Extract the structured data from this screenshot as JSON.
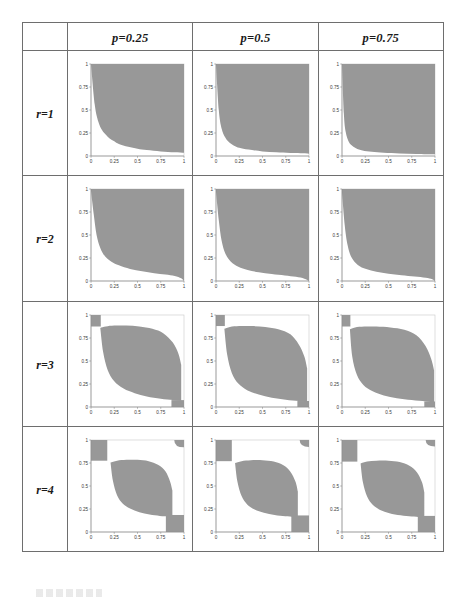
{
  "figure": {
    "title": "",
    "corner_label": "",
    "columns": [
      {
        "id": "col-p025",
        "label": "p=0.25",
        "p": 0.25
      },
      {
        "id": "col-p05",
        "label": "p=0.5",
        "p": 0.5
      },
      {
        "id": "col-p075",
        "label": "p=0.75",
        "p": 0.75
      }
    ],
    "rows": [
      {
        "id": "row-r1",
        "label": "r=1",
        "r": 1
      },
      {
        "id": "row-r2",
        "label": "r=2",
        "r": 2
      },
      {
        "id": "row-r3",
        "label": "r=3",
        "r": 3
      },
      {
        "id": "row-r4",
        "label": "r=4",
        "r": 4
      }
    ]
  },
  "axes": {
    "x_ticks": [
      "0",
      "0.25",
      "0.5",
      "0.75",
      "1"
    ],
    "y_ticks": [
      "0",
      "0.25",
      "0.5",
      "0.75",
      "1"
    ],
    "xlim": [
      0,
      1
    ],
    "ylim": [
      0,
      1
    ]
  },
  "colors": {
    "region_fill": "#989898",
    "grid_border": "#6e6e6e",
    "axis": "#8c8c8c",
    "frame": "#c8c8c8",
    "text": "#1a1a1a"
  },
  "chart_data": {
    "type": "area",
    "title": "",
    "xlabel": "",
    "ylabel": "",
    "xlim": [
      0,
      1
    ],
    "ylim": [
      0,
      1
    ],
    "grid": false,
    "legend": "none",
    "x_ticks": [
      0,
      0.25,
      0.5,
      0.75,
      1
    ],
    "y_ticks": [
      0,
      0.25,
      0.5,
      0.75,
      1
    ],
    "row_parameter": "r",
    "col_parameter": "p",
    "row_values": [
      1,
      2,
      3,
      4
    ],
    "col_values": [
      0.25,
      0.5,
      0.75
    ],
    "panels": [
      {
        "id": "r1-p025",
        "r": 1,
        "p": 0.25,
        "shape": "upper-right-hyperbolic",
        "boundary_x": [
          0.0,
          0.04,
          0.08,
          0.12,
          0.16,
          0.2,
          0.25,
          0.3,
          0.4,
          0.5,
          0.6,
          0.75,
          0.9,
          1.0
        ],
        "boundary_y": [
          1.0,
          0.56,
          0.37,
          0.28,
          0.23,
          0.19,
          0.16,
          0.13,
          0.1,
          0.08,
          0.065,
          0.05,
          0.04,
          0.035
        ],
        "fill_side": "above",
        "corner_blocks": []
      },
      {
        "id": "r1-p05",
        "r": 1,
        "p": 0.5,
        "shape": "upper-right-hyperbolic",
        "boundary_x": [
          0.0,
          0.03,
          0.06,
          0.1,
          0.14,
          0.2,
          0.25,
          0.35,
          0.5,
          0.65,
          0.8,
          1.0
        ],
        "boundary_y": [
          1.0,
          0.5,
          0.3,
          0.2,
          0.15,
          0.11,
          0.09,
          0.07,
          0.05,
          0.04,
          0.032,
          0.025
        ],
        "fill_side": "above",
        "corner_blocks": []
      },
      {
        "id": "r1-p075",
        "r": 1,
        "p": 0.75,
        "shape": "upper-right-hyperbolic-steep",
        "boundary_x": [
          0.0,
          0.02,
          0.04,
          0.07,
          0.1,
          0.15,
          0.22,
          0.32,
          0.45,
          0.62,
          0.8,
          1.0
        ],
        "boundary_y": [
          1.0,
          0.46,
          0.26,
          0.16,
          0.12,
          0.085,
          0.06,
          0.045,
          0.034,
          0.026,
          0.021,
          0.018
        ],
        "fill_side": "above",
        "corner_blocks": []
      },
      {
        "id": "r2-p025",
        "r": 2,
        "p": 0.25,
        "shape": "rounded-upper-right",
        "boundary_x": [
          0.0,
          0.03,
          0.06,
          0.1,
          0.15,
          0.22,
          0.3,
          0.42,
          0.55,
          0.68,
          0.8,
          0.9,
          0.97,
          1.0
        ],
        "boundary_y": [
          0.98,
          0.72,
          0.5,
          0.36,
          0.27,
          0.21,
          0.17,
          0.13,
          0.105,
          0.085,
          0.07,
          0.055,
          0.03,
          0.0
        ],
        "top_left_start": [
          0.0,
          0.985
        ],
        "fill_side": "above",
        "corner_blocks": []
      },
      {
        "id": "r2-p05",
        "r": 2,
        "p": 0.5,
        "shape": "rounded-upper-right",
        "boundary_x": [
          0.0,
          0.03,
          0.06,
          0.1,
          0.16,
          0.24,
          0.34,
          0.46,
          0.6,
          0.74,
          0.86,
          0.95,
          1.0
        ],
        "boundary_y": [
          0.97,
          0.66,
          0.44,
          0.3,
          0.21,
          0.155,
          0.12,
          0.095,
          0.075,
          0.06,
          0.045,
          0.025,
          0.0
        ],
        "fill_side": "above",
        "corner_blocks": []
      },
      {
        "id": "r2-p075",
        "r": 2,
        "p": 0.75,
        "shape": "rounded-upper-right",
        "boundary_x": [
          0.0,
          0.03,
          0.06,
          0.1,
          0.17,
          0.26,
          0.37,
          0.5,
          0.64,
          0.78,
          0.9,
          0.97,
          1.0
        ],
        "boundary_y": [
          0.96,
          0.6,
          0.39,
          0.26,
          0.175,
          0.13,
          0.1,
          0.08,
          0.062,
          0.048,
          0.035,
          0.02,
          0.0
        ],
        "fill_side": "above",
        "corner_blocks": []
      },
      {
        "id": "r3-p025",
        "r": 3,
        "p": 0.25,
        "shape": "s-curve-lens",
        "upper_x": [
          0.1,
          0.16,
          0.25,
          0.38,
          0.52,
          0.66,
          0.78,
          0.88,
          0.94,
          0.97
        ],
        "upper_y": [
          0.86,
          0.875,
          0.885,
          0.885,
          0.875,
          0.85,
          0.8,
          0.7,
          0.58,
          0.46
        ],
        "lower_x": [
          0.1,
          0.13,
          0.18,
          0.25,
          0.35,
          0.47,
          0.6,
          0.75,
          0.88,
          0.97
        ],
        "lower_y": [
          0.86,
          0.6,
          0.4,
          0.28,
          0.2,
          0.15,
          0.115,
          0.09,
          0.075,
          0.065
        ],
        "fill_side": "between",
        "corner_blocks": [
          {
            "corner": "top-left",
            "x0": 0.0,
            "x1": 0.105,
            "y0": 0.875,
            "y1": 1.0
          },
          {
            "corner": "bottom-right",
            "x0": 0.865,
            "x1": 1.0,
            "y0": 0.0,
            "y1": 0.075
          }
        ]
      },
      {
        "id": "r3-p05",
        "r": 3,
        "p": 0.5,
        "shape": "s-curve-lens",
        "upper_x": [
          0.09,
          0.15,
          0.25,
          0.38,
          0.53,
          0.67,
          0.8,
          0.89,
          0.95,
          0.98
        ],
        "upper_y": [
          0.85,
          0.87,
          0.88,
          0.88,
          0.87,
          0.845,
          0.79,
          0.68,
          0.55,
          0.42
        ],
        "lower_x": [
          0.09,
          0.12,
          0.17,
          0.24,
          0.34,
          0.46,
          0.6,
          0.75,
          0.89,
          0.98
        ],
        "lower_y": [
          0.85,
          0.57,
          0.37,
          0.255,
          0.18,
          0.135,
          0.1,
          0.08,
          0.065,
          0.055
        ],
        "fill_side": "between",
        "corner_blocks": [
          {
            "corner": "top-left",
            "x0": 0.0,
            "x1": 0.095,
            "y0": 0.88,
            "y1": 1.0
          },
          {
            "corner": "bottom-right",
            "x0": 0.875,
            "x1": 1.0,
            "y0": 0.0,
            "y1": 0.065
          }
        ]
      },
      {
        "id": "r3-p075",
        "r": 3,
        "p": 0.75,
        "shape": "s-curve-lens",
        "upper_x": [
          0.085,
          0.14,
          0.24,
          0.37,
          0.52,
          0.67,
          0.8,
          0.9,
          0.96,
          0.99
        ],
        "upper_y": [
          0.845,
          0.865,
          0.875,
          0.875,
          0.865,
          0.84,
          0.78,
          0.66,
          0.52,
          0.4
        ],
        "lower_x": [
          0.085,
          0.11,
          0.16,
          0.23,
          0.33,
          0.45,
          0.59,
          0.75,
          0.9,
          0.99
        ],
        "lower_y": [
          0.845,
          0.55,
          0.35,
          0.24,
          0.17,
          0.125,
          0.095,
          0.075,
          0.06,
          0.05
        ],
        "fill_side": "between",
        "corner_blocks": [
          {
            "corner": "top-left",
            "x0": 0.0,
            "x1": 0.09,
            "y0": 0.875,
            "y1": 1.0
          },
          {
            "corner": "bottom-right",
            "x0": 0.885,
            "x1": 1.0,
            "y0": 0.0,
            "y1": 0.06
          }
        ]
      },
      {
        "id": "r4-p025",
        "r": 4,
        "p": 0.25,
        "shape": "s-curve-lens-4corner",
        "upper_x": [
          0.21,
          0.28,
          0.38,
          0.5,
          0.62,
          0.72,
          0.8,
          0.85,
          0.875
        ],
        "upper_y": [
          0.755,
          0.775,
          0.785,
          0.785,
          0.77,
          0.73,
          0.66,
          0.55,
          0.45
        ],
        "lower_x": [
          0.21,
          0.235,
          0.28,
          0.34,
          0.42,
          0.52,
          0.63,
          0.74,
          0.83,
          0.875
        ],
        "lower_y": [
          0.755,
          0.56,
          0.4,
          0.31,
          0.255,
          0.215,
          0.19,
          0.175,
          0.17,
          0.17
        ],
        "fill_side": "between",
        "corner_blocks": [
          {
            "corner": "top-left",
            "x0": 0.0,
            "x1": 0.175,
            "y0": 0.775,
            "y1": 1.0
          },
          {
            "corner": "top-right",
            "x0": 0.895,
            "x1": 1.0,
            "y0": 0.92,
            "y1": 1.0,
            "rounded": true
          },
          {
            "corner": "bottom-right",
            "x0": 0.805,
            "x1": 1.0,
            "y0": 0.0,
            "y1": 0.185
          }
        ]
      },
      {
        "id": "r4-p05",
        "r": 4,
        "p": 0.5,
        "shape": "s-curve-lens-4corner",
        "upper_x": [
          0.205,
          0.275,
          0.375,
          0.5,
          0.62,
          0.725,
          0.8,
          0.855,
          0.88
        ],
        "upper_y": [
          0.75,
          0.77,
          0.78,
          0.78,
          0.765,
          0.725,
          0.655,
          0.545,
          0.44
        ],
        "lower_x": [
          0.205,
          0.23,
          0.275,
          0.335,
          0.415,
          0.515,
          0.63,
          0.745,
          0.835,
          0.88
        ],
        "lower_y": [
          0.75,
          0.55,
          0.39,
          0.3,
          0.245,
          0.21,
          0.185,
          0.17,
          0.165,
          0.165
        ],
        "fill_side": "between",
        "corner_blocks": [
          {
            "corner": "top-left",
            "x0": 0.0,
            "x1": 0.17,
            "y0": 0.77,
            "y1": 1.0
          },
          {
            "corner": "top-right",
            "x0": 0.9,
            "x1": 1.0,
            "y0": 0.925,
            "y1": 1.0,
            "rounded": true
          },
          {
            "corner": "bottom-right",
            "x0": 0.81,
            "x1": 1.0,
            "y0": 0.0,
            "y1": 0.18
          }
        ]
      },
      {
        "id": "r4-p075",
        "r": 4,
        "p": 0.75,
        "shape": "s-curve-lens-4corner",
        "upper_x": [
          0.2,
          0.27,
          0.37,
          0.5,
          0.62,
          0.725,
          0.805,
          0.86,
          0.885
        ],
        "upper_y": [
          0.745,
          0.765,
          0.775,
          0.775,
          0.76,
          0.72,
          0.65,
          0.54,
          0.43
        ],
        "lower_x": [
          0.2,
          0.225,
          0.27,
          0.33,
          0.41,
          0.51,
          0.63,
          0.75,
          0.84,
          0.885
        ],
        "lower_y": [
          0.745,
          0.54,
          0.385,
          0.295,
          0.24,
          0.205,
          0.182,
          0.168,
          0.162,
          0.16
        ],
        "fill_side": "between",
        "corner_blocks": [
          {
            "corner": "top-left",
            "x0": 0.0,
            "x1": 0.165,
            "y0": 0.765,
            "y1": 1.0
          },
          {
            "corner": "top-right",
            "x0": 0.9,
            "x1": 1.0,
            "y0": 0.93,
            "y1": 1.0,
            "rounded": true
          },
          {
            "corner": "bottom-right",
            "x0": 0.815,
            "x1": 1.0,
            "y0": 0.0,
            "y1": 0.175
          }
        ]
      }
    ]
  }
}
